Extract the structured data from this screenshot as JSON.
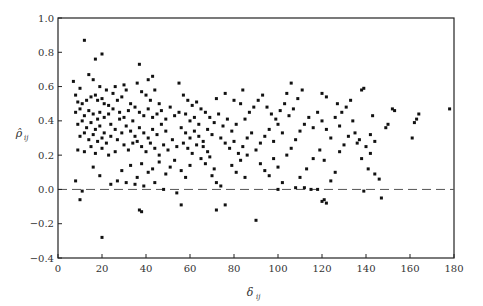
{
  "chart_data": {
    "type": "scatter",
    "title": "",
    "xlabel": "δ_ij",
    "ylabel": "ρ̂_ij",
    "xlim": [
      0,
      180
    ],
    "ylim": [
      -0.4,
      1.0
    ],
    "x_ticks": [
      0,
      20,
      40,
      60,
      80,
      100,
      120,
      140,
      160,
      180
    ],
    "y_ticks": [
      -0.4,
      -0.2,
      0.0,
      0.2,
      0.4,
      0.6,
      0.8,
      1.0
    ],
    "x_tick_labels": [
      "0",
      "20",
      "40",
      "60",
      "80",
      "100",
      "120",
      "140",
      "160",
      "180"
    ],
    "y_tick_labels": [
      "−0.4",
      "−0.2",
      "0.0",
      "0.2",
      "0.4",
      "0.6",
      "0.8",
      "1.0"
    ],
    "grid": false,
    "legend": null,
    "reference_line": {
      "y": 0.0,
      "style": "dashed"
    },
    "marker": {
      "shape": "square",
      "color": "#111111",
      "size": 3
    },
    "series": [
      {
        "name": "pairs",
        "points": [
          [
            12,
            0.87
          ],
          [
            17,
            0.76
          ],
          [
            20,
            0.79
          ],
          [
            37,
            0.73
          ],
          [
            7,
            0.63
          ],
          [
            10,
            0.59
          ],
          [
            14,
            0.67
          ],
          [
            16,
            0.64
          ],
          [
            19,
            0.6
          ],
          [
            22,
            0.58
          ],
          [
            8,
            0.55
          ],
          [
            9,
            0.51
          ],
          [
            11,
            0.5
          ],
          [
            13,
            0.52
          ],
          [
            15,
            0.54
          ],
          [
            17,
            0.55
          ],
          [
            18,
            0.52
          ],
          [
            20,
            0.53
          ],
          [
            21,
            0.5
          ],
          [
            23,
            0.49
          ],
          [
            8,
            0.45
          ],
          [
            10,
            0.47
          ],
          [
            12,
            0.43
          ],
          [
            14,
            0.46
          ],
          [
            16,
            0.44
          ],
          [
            18,
            0.41
          ],
          [
            19,
            0.45
          ],
          [
            21,
            0.42
          ],
          [
            23,
            0.44
          ],
          [
            25,
            0.47
          ],
          [
            9,
            0.38
          ],
          [
            11,
            0.4
          ],
          [
            13,
            0.36
          ],
          [
            15,
            0.39
          ],
          [
            17,
            0.35
          ],
          [
            19,
            0.37
          ],
          [
            21,
            0.33
          ],
          [
            24,
            0.38
          ],
          [
            26,
            0.35
          ],
          [
            28,
            0.41
          ],
          [
            10,
            0.31
          ],
          [
            12,
            0.33
          ],
          [
            14,
            0.29
          ],
          [
            16,
            0.32
          ],
          [
            18,
            0.28
          ],
          [
            20,
            0.3
          ],
          [
            22,
            0.27
          ],
          [
            24,
            0.31
          ],
          [
            27,
            0.29
          ],
          [
            29,
            0.33
          ],
          [
            9,
            0.23
          ],
          [
            12,
            0.22
          ],
          [
            15,
            0.25
          ],
          [
            17,
            0.21
          ],
          [
            20,
            0.24
          ],
          [
            23,
            0.2
          ],
          [
            26,
            0.22
          ],
          [
            30,
            0.26
          ],
          [
            32,
            0.23
          ],
          [
            34,
            0.27
          ],
          [
            8,
            0.05
          ],
          [
            11,
            -0.01
          ],
          [
            10,
            -0.06
          ],
          [
            16,
            0.13
          ],
          [
            19,
            0.08
          ],
          [
            24,
            0.03
          ],
          [
            27,
            0.05
          ],
          [
            29,
            0.11
          ],
          [
            33,
            0.14
          ],
          [
            36,
            0.07
          ],
          [
            20,
            -0.28
          ],
          [
            38,
            -0.13
          ],
          [
            37,
            -0.12
          ],
          [
            39,
            0.02
          ],
          [
            35,
            0.03
          ],
          [
            31,
            0.04
          ],
          [
            44,
            0.04
          ],
          [
            48,
            0.0
          ],
          [
            54,
            -0.02
          ],
          [
            56,
            -0.09
          ],
          [
            25,
            0.56
          ],
          [
            27,
            0.52
          ],
          [
            29,
            0.54
          ],
          [
            31,
            0.58
          ],
          [
            33,
            0.5
          ],
          [
            35,
            0.48
          ],
          [
            28,
            0.45
          ],
          [
            30,
            0.42
          ],
          [
            32,
            0.46
          ],
          [
            34,
            0.4
          ],
          [
            26,
            0.6
          ],
          [
            30,
            0.61
          ],
          [
            36,
            0.62
          ],
          [
            38,
            0.57
          ],
          [
            40,
            0.55
          ],
          [
            42,
            0.52
          ],
          [
            44,
            0.58
          ],
          [
            46,
            0.5
          ],
          [
            41,
            0.64
          ],
          [
            43,
            0.66
          ],
          [
            31,
            0.37
          ],
          [
            33,
            0.34
          ],
          [
            35,
            0.31
          ],
          [
            37,
            0.36
          ],
          [
            39,
            0.33
          ],
          [
            41,
            0.3
          ],
          [
            43,
            0.35
          ],
          [
            45,
            0.32
          ],
          [
            47,
            0.38
          ],
          [
            49,
            0.34
          ],
          [
            36,
            0.28
          ],
          [
            38,
            0.25
          ],
          [
            40,
            0.22
          ],
          [
            42,
            0.27
          ],
          [
            44,
            0.24
          ],
          [
            46,
            0.2
          ],
          [
            48,
            0.26
          ],
          [
            50,
            0.23
          ],
          [
            52,
            0.29
          ],
          [
            54,
            0.25
          ],
          [
            37,
            0.45
          ],
          [
            39,
            0.43
          ],
          [
            41,
            0.47
          ],
          [
            43,
            0.42
          ],
          [
            45,
            0.44
          ],
          [
            47,
            0.46
          ],
          [
            49,
            0.41
          ],
          [
            51,
            0.48
          ],
          [
            53,
            0.43
          ],
          [
            55,
            0.45
          ],
          [
            38,
            0.15
          ],
          [
            41,
            0.1
          ],
          [
            43,
            0.12
          ],
          [
            46,
            0.16
          ],
          [
            49,
            0.09
          ],
          [
            51,
            0.13
          ],
          [
            53,
            0.17
          ],
          [
            56,
            0.11
          ],
          [
            58,
            0.07
          ],
          [
            60,
            0.14
          ],
          [
            55,
            0.62
          ],
          [
            57,
            0.55
          ],
          [
            59,
            0.52
          ],
          [
            61,
            0.49
          ],
          [
            63,
            0.51
          ],
          [
            65,
            0.47
          ],
          [
            58,
            0.44
          ],
          [
            60,
            0.4
          ],
          [
            62,
            0.42
          ],
          [
            64,
            0.38
          ],
          [
            56,
            0.36
          ],
          [
            58,
            0.33
          ],
          [
            60,
            0.3
          ],
          [
            62,
            0.34
          ],
          [
            64,
            0.31
          ],
          [
            66,
            0.28
          ],
          [
            68,
            0.35
          ],
          [
            70,
            0.32
          ],
          [
            66,
            0.25
          ],
          [
            68,
            0.22
          ],
          [
            57,
            0.27
          ],
          [
            59,
            0.24
          ],
          [
            61,
            0.21
          ],
          [
            63,
            0.26
          ],
          [
            65,
            0.18
          ],
          [
            67,
            0.15
          ],
          [
            69,
            0.19
          ],
          [
            71,
            0.12
          ],
          [
            70,
            0.08
          ],
          [
            72,
            0.04
          ],
          [
            67,
            0.45
          ],
          [
            69,
            0.42
          ],
          [
            71,
            0.39
          ],
          [
            73,
            0.44
          ],
          [
            75,
            0.37
          ],
          [
            77,
            0.41
          ],
          [
            79,
            0.34
          ],
          [
            81,
            0.38
          ],
          [
            74,
            0.3
          ],
          [
            76,
            0.27
          ],
          [
            78,
            0.24
          ],
          [
            80,
            0.28
          ],
          [
            82,
            0.21
          ],
          [
            84,
            0.25
          ],
          [
            86,
            0.3
          ],
          [
            88,
            0.33
          ],
          [
            85,
            0.41
          ],
          [
            87,
            0.45
          ],
          [
            89,
            0.48
          ],
          [
            83,
            0.5
          ],
          [
            72,
            0.53
          ],
          [
            76,
            0.56
          ],
          [
            80,
            0.52
          ],
          [
            84,
            0.58
          ],
          [
            79,
            0.14
          ],
          [
            81,
            0.1
          ],
          [
            83,
            0.17
          ],
          [
            85,
            0.07
          ],
          [
            74,
            0.02
          ],
          [
            76,
            -0.09
          ],
          [
            72,
            -0.12
          ],
          [
            90,
            -0.18
          ],
          [
            86,
            0.2
          ],
          [
            90,
            0.23
          ],
          [
            92,
            0.27
          ],
          [
            94,
            0.31
          ],
          [
            96,
            0.35
          ],
          [
            98,
            0.28
          ],
          [
            100,
            0.38
          ],
          [
            102,
            0.33
          ],
          [
            91,
            0.52
          ],
          [
            93,
            0.55
          ],
          [
            95,
            0.48
          ],
          [
            97,
            0.44
          ],
          [
            99,
            0.41
          ],
          [
            101,
            0.46
          ],
          [
            103,
            0.5
          ],
          [
            105,
            0.43
          ],
          [
            107,
            0.47
          ],
          [
            104,
            0.56
          ],
          [
            92,
            0.15
          ],
          [
            94,
            0.11
          ],
          [
            96,
            0.08
          ],
          [
            98,
            0.18
          ],
          [
            100,
            0.13
          ],
          [
            102,
            0.04
          ],
          [
            104,
            0.2
          ],
          [
            106,
            0.24
          ],
          [
            108,
            0.29
          ],
          [
            110,
            0.34
          ],
          [
            100,
            0.0
          ],
          [
            108,
            0.01
          ],
          [
            112,
            0.01
          ],
          [
            115,
            0.0
          ],
          [
            118,
            0.0
          ],
          [
            110,
            0.07
          ],
          [
            113,
            0.12
          ],
          [
            116,
            0.18
          ],
          [
            119,
            0.23
          ],
          [
            121,
            0.17
          ],
          [
            112,
            0.38
          ],
          [
            114,
            0.42
          ],
          [
            116,
            0.36
          ],
          [
            118,
            0.45
          ],
          [
            120,
            0.4
          ],
          [
            122,
            0.35
          ],
          [
            124,
            0.3
          ],
          [
            109,
            0.53
          ],
          [
            111,
            0.58
          ],
          [
            106,
            0.62
          ],
          [
            120,
            -0.07
          ],
          [
            122,
            -0.08
          ],
          [
            121,
            -0.06
          ],
          [
            124,
            0.05
          ],
          [
            126,
            0.1
          ],
          [
            128,
            0.22
          ],
          [
            130,
            0.26
          ],
          [
            132,
            0.31
          ],
          [
            134,
            0.4
          ],
          [
            136,
            0.27
          ],
          [
            120,
            0.56
          ],
          [
            122,
            0.54
          ],
          [
            127,
            0.5
          ],
          [
            129,
            0.45
          ],
          [
            131,
            0.48
          ],
          [
            133,
            0.52
          ],
          [
            138,
            0.58
          ],
          [
            139,
            0.59
          ],
          [
            126,
            0.42
          ],
          [
            128,
            0.37
          ],
          [
            135,
            0.33
          ],
          [
            137,
            0.29
          ],
          [
            140,
            0.25
          ],
          [
            142,
            0.21
          ],
          [
            138,
            0.18
          ],
          [
            141,
            0.12
          ],
          [
            144,
            0.09
          ],
          [
            139,
            -0.01
          ],
          [
            147,
            -0.05
          ],
          [
            146,
            0.06
          ],
          [
            142,
            0.32
          ],
          [
            144,
            0.28
          ],
          [
            149,
            0.36
          ],
          [
            150,
            0.38
          ],
          [
            152,
            0.47
          ],
          [
            153,
            0.46
          ],
          [
            143,
            0.43
          ],
          [
            161,
            0.3
          ],
          [
            162,
            0.39
          ],
          [
            163,
            0.41
          ],
          [
            164,
            0.44
          ],
          [
            178,
            0.47
          ]
        ]
      }
    ]
  }
}
